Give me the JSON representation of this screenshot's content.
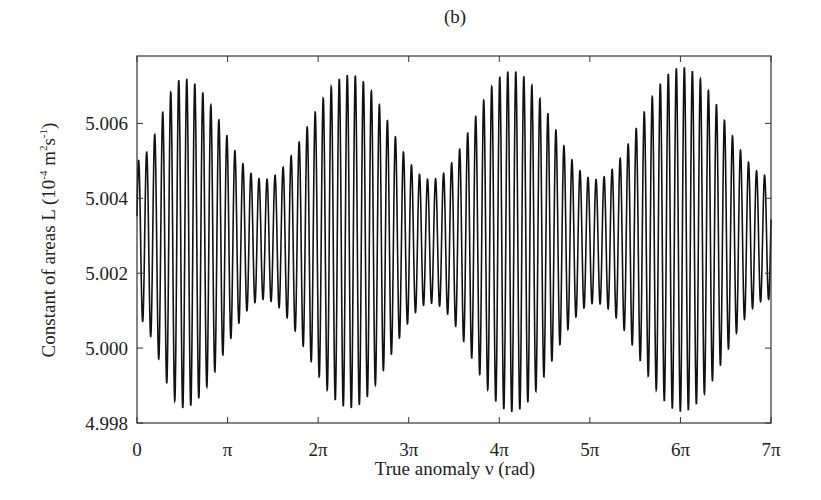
{
  "chart_data": {
    "type": "line",
    "title": "(b)",
    "xlabel": "True anomaly ν (rad)",
    "ylabel": "Constant of areas L (10",
    "ylabel_exp1": "-4",
    "ylabel_mid": " m",
    "ylabel_exp2": "2",
    "ylabel_mid2": "s",
    "ylabel_exp3": "-1",
    "ylabel_end": ")",
    "xlim": [
      0,
      21.9911
    ],
    "ylim": [
      4.998,
      5.0078
    ],
    "xticks": [
      0,
      3.1416,
      6.2832,
      9.4248,
      12.5664,
      15.708,
      18.8496,
      21.9911
    ],
    "xtick_labels": [
      "0",
      "π",
      "2π",
      "3π",
      "4π",
      "5π",
      "6π",
      "7π"
    ],
    "yticks": [
      4.998,
      5.0,
      5.002,
      5.004,
      5.006
    ],
    "ytick_labels": [
      "4.998",
      "5.000",
      "5.002",
      "5.004",
      "5.006"
    ],
    "grid": false,
    "legend": null,
    "series": [
      {
        "name": "L(ν)",
        "description": "fast oscillation (~79 cycles over 0–7π) with slowly modulated envelope of period ~2π",
        "mean": 5.0029,
        "envelope_max_amplitude": 0.0044,
        "envelope_min_amplitude": 0.0016,
        "envelope_peaks_at": [
          1.6,
          7.4,
          13.0,
          18.9
        ],
        "fast_cycles": 79,
        "values_envelope_upper": [
          5.005,
          5.0072,
          5.0045,
          5.0073,
          5.0045,
          5.0074,
          5.0045,
          5.0075,
          5.0046
        ],
        "values_envelope_lower": [
          5.0008,
          4.9984,
          5.0013,
          4.9984,
          5.0012,
          4.9983,
          5.0012,
          4.9983,
          5.0013
        ],
        "envelope_x": [
          0,
          1.6,
          4.4,
          7.4,
          10.2,
          13.0,
          15.9,
          18.9,
          21.9
        ]
      }
    ]
  }
}
